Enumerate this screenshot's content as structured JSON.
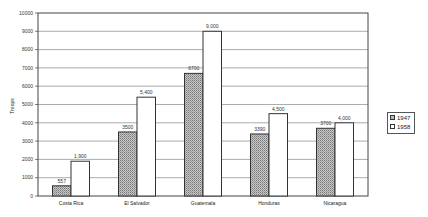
{
  "chart_data": {
    "type": "bar",
    "title": "",
    "xlabel": "",
    "ylabel": "Troops",
    "ylim": [
      0,
      10000
    ],
    "yticks": [
      0,
      1000,
      2000,
      3000,
      4000,
      5000,
      6000,
      7000,
      8000,
      9000,
      10000
    ],
    "grid": true,
    "legend_position": "right",
    "categories": [
      "Costa Rica",
      "El Salvador",
      "Guatemala",
      "Honduras",
      "Nicaragua"
    ],
    "series": [
      {
        "name": "1947",
        "values": [
          557,
          3500,
          6700,
          3390,
          3700
        ],
        "labels": [
          "557",
          "3500",
          "6700",
          "3390",
          "3700"
        ],
        "fill": "hatched-gray"
      },
      {
        "name": "1958",
        "values": [
          1900,
          5400,
          9000,
          4500,
          4000
        ],
        "labels": [
          "1,900",
          "5,400",
          "9,000",
          "4,500",
          "4,000"
        ],
        "fill": "white"
      }
    ]
  },
  "legend": {
    "items": [
      {
        "label": "1947"
      },
      {
        "label": "1958"
      }
    ]
  },
  "axis": {
    "ylabel": "Troops"
  }
}
